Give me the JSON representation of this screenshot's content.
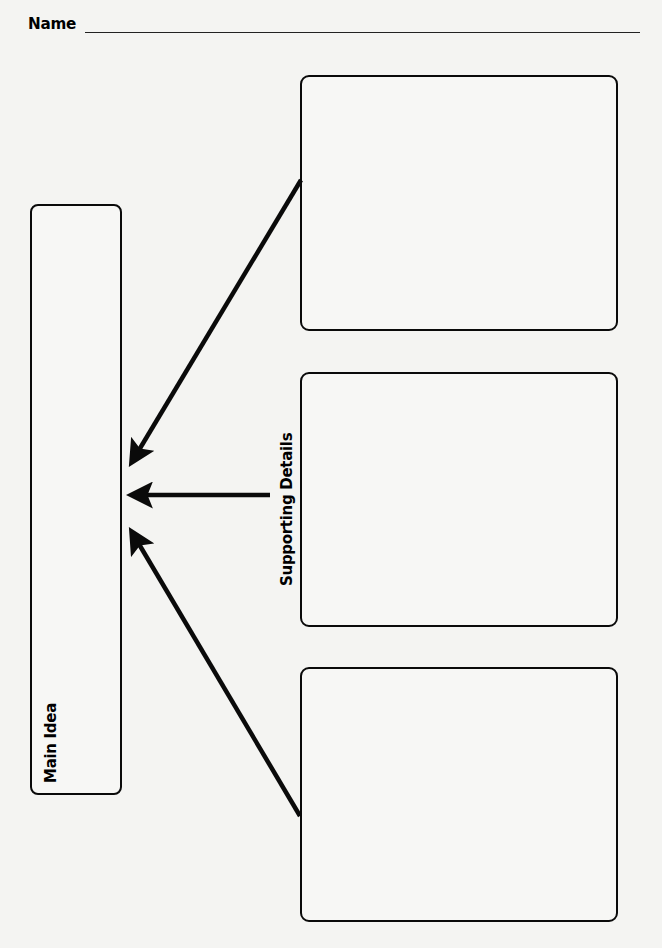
{
  "header": {
    "name_label": "Name"
  },
  "organizer": {
    "main_idea_label": "Main Idea",
    "supporting_details_label": "Supporting Details",
    "detail_boxes": [
      {
        "id": "detail-1",
        "content": ""
      },
      {
        "id": "detail-2",
        "content": ""
      },
      {
        "id": "detail-3",
        "content": ""
      }
    ],
    "arrows": [
      {
        "from": "detail-1",
        "to": "main-idea",
        "direction": "diagonal-down-left"
      },
      {
        "from": "supporting-details",
        "to": "main-idea",
        "direction": "horizontal-left"
      },
      {
        "from": "detail-3",
        "to": "main-idea",
        "direction": "diagonal-up-left"
      }
    ]
  },
  "colors": {
    "ink": "#0a0a0a",
    "paper": "#f4f4f2"
  }
}
